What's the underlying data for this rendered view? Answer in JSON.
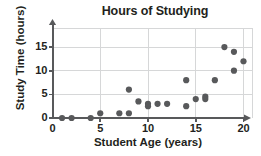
{
  "chart_data": {
    "type": "scatter",
    "title": "Hours of Studying",
    "xlabel": "Student Age (years)",
    "ylabel": "Study Time (hours)",
    "xlim": [
      0,
      20.8
    ],
    "ylim": [
      0,
      16.5
    ],
    "xticks": [
      0,
      5,
      10,
      15,
      20
    ],
    "yticks": [
      0,
      5,
      10,
      15
    ],
    "grid": true,
    "legend": null,
    "marker_color": "#58595b",
    "grid_color": "#d6d7d8",
    "axis_color": "#58595b",
    "points": [
      {
        "x": 1,
        "y": 0
      },
      {
        "x": 2,
        "y": 0
      },
      {
        "x": 4,
        "y": 0
      },
      {
        "x": 5,
        "y": 1
      },
      {
        "x": 7,
        "y": 1
      },
      {
        "x": 8,
        "y": 1
      },
      {
        "x": 8,
        "y": 6
      },
      {
        "x": 9,
        "y": 3.5
      },
      {
        "x": 10,
        "y": 3
      },
      {
        "x": 10,
        "y": 2.5
      },
      {
        "x": 11,
        "y": 3
      },
      {
        "x": 12,
        "y": 3
      },
      {
        "x": 14,
        "y": 8
      },
      {
        "x": 14,
        "y": 2.5
      },
      {
        "x": 15,
        "y": 4
      },
      {
        "x": 16,
        "y": 4.5
      },
      {
        "x": 16,
        "y": 4
      },
      {
        "x": 17,
        "y": 8
      },
      {
        "x": 18,
        "y": 15
      },
      {
        "x": 19,
        "y": 14
      },
      {
        "x": 19,
        "y": 10
      },
      {
        "x": 20,
        "y": 12
      }
    ],
    "xtick_labels": [
      "0",
      "5",
      "10",
      "15",
      "20"
    ],
    "ytick_labels": [
      "0",
      "5",
      "10",
      "15"
    ]
  }
}
